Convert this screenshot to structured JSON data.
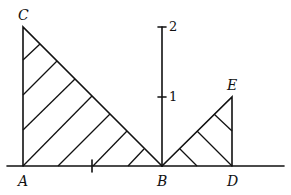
{
  "diagram": {
    "type": "geometry-figure",
    "points": {
      "A": {
        "label": "A",
        "x": 23,
        "y": 166
      },
      "B": {
        "label": "B",
        "x": 162,
        "y": 166
      },
      "C": {
        "label": "C",
        "x": 23,
        "y": 27
      },
      "D": {
        "label": "D",
        "x": 232,
        "y": 166
      },
      "E": {
        "label": "E",
        "x": 232,
        "y": 97
      }
    },
    "axis": {
      "tick_labels": [
        "1",
        "2"
      ]
    },
    "shapes": [
      {
        "name": "triangle ACB",
        "hatched": true
      },
      {
        "name": "triangle BDE",
        "hatched": true
      }
    ]
  }
}
